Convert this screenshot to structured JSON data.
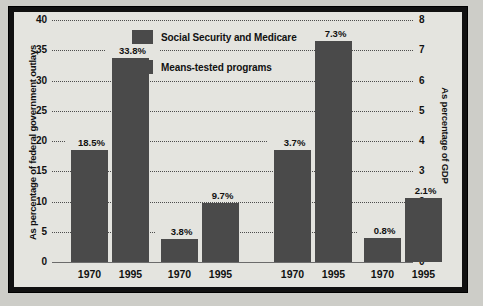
{
  "chart_data": {
    "type": "bar",
    "title": "",
    "panels": [
      {
        "name": "outlays",
        "ylabel": "As percentage of federal government outlays",
        "ylim": [
          0,
          40
        ],
        "yticks": [
          0,
          5,
          10,
          15,
          20,
          25,
          30,
          35,
          40
        ],
        "ytick_labels": [
          "0",
          "5",
          "10",
          "15",
          "20",
          "25",
          "30",
          "35",
          "40"
        ],
        "categories": [
          "1970",
          "1995",
          "1970",
          "1995"
        ],
        "bars": [
          {
            "series": "Social Security and Medicare",
            "x": "1970",
            "value": 18.5,
            "label": "18.5%"
          },
          {
            "series": "Social Security and Medicare",
            "x": "1995",
            "value": 33.8,
            "label": "33.8%"
          },
          {
            "series": "Means-tested programs",
            "x": "1970",
            "value": 3.8,
            "label": "3.8%"
          },
          {
            "series": "Means-tested programs",
            "x": "1995",
            "value": 9.7,
            "label": "9.7%"
          }
        ]
      },
      {
        "name": "gdp",
        "ylabel": "As percentage of GDP",
        "ylim": [
          0,
          8
        ],
        "yticks": [
          0,
          1,
          2,
          3,
          4,
          5,
          6,
          7,
          8
        ],
        "ytick_labels": [
          "0",
          "1",
          "2",
          "3",
          "4",
          "5",
          "6",
          "7",
          "8"
        ],
        "categories": [
          "1970",
          "1995",
          "1970",
          "1995"
        ],
        "bars": [
          {
            "series": "Social Security and Medicare",
            "x": "1970",
            "value": 3.7,
            "label": "3.7%"
          },
          {
            "series": "Social Security and Medicare",
            "x": "1995",
            "value": 7.3,
            "label": "7.3%"
          },
          {
            "series": "Means-tested programs",
            "x": "1970",
            "value": 0.8,
            "label": "0.8%"
          },
          {
            "series": "Means-tested programs",
            "x": "1995",
            "value": 2.1,
            "label": "2.1%"
          }
        ]
      }
    ],
    "legend": {
      "position": "top-center",
      "entries": [
        {
          "label": "Social Security and Medicare",
          "color": "#4a4a4a"
        },
        {
          "label": "Means-tested programs",
          "color": "#4a4a4a"
        }
      ]
    },
    "grid": true,
    "bar_color": "#4a4a4a",
    "background_color": "#e4e4df",
    "frame_color": "#111111"
  }
}
